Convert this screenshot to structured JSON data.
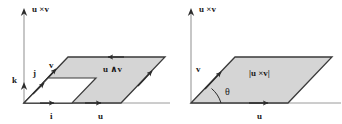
{
  "figure": {
    "background_color": "#ffffff",
    "fill_color": "#d5d5d5",
    "stroke_color": "#3a3a3a",
    "axis_color": "#8f8f8f",
    "label_color": "#1a1a1a"
  },
  "left_panel": {
    "name": "cross-product-basis-diagram",
    "axis_label": "u ×v",
    "labels": {
      "k": "k",
      "j": "j",
      "i": "i",
      "v": "v",
      "u": "u",
      "wedge": "u ∧v"
    }
  },
  "right_panel": {
    "name": "cross-product-magnitude-diagram",
    "axis_label": "u ×v",
    "labels": {
      "v": "v",
      "u": "u",
      "theta": "θ",
      "magnitude": "|u ×v|"
    }
  }
}
